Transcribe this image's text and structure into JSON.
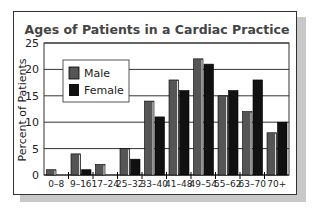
{
  "chart_data": {
    "type": "bar",
    "title": "Ages of Patients in a Cardiac Practice",
    "xlabel": "",
    "ylabel": "Percent of Patients",
    "ylim": [
      0,
      25
    ],
    "yticks": [
      "0",
      "5",
      "10",
      "15",
      "20",
      "25"
    ],
    "grid": true,
    "legend_position": "top-left",
    "categories": [
      "0–8",
      "9–16",
      "17–24",
      "25–32",
      "33–40",
      "41–48",
      "49–54",
      "55–62",
      "63–70",
      "70+"
    ],
    "series": [
      {
        "name": "Male",
        "color": "#555555",
        "values": [
          1,
          4,
          2,
          5,
          14,
          18,
          22,
          15,
          12,
          8
        ]
      },
      {
        "name": "Female",
        "color": "#111111",
        "values": [
          0,
          1,
          0,
          3,
          11,
          16,
          21,
          16,
          18,
          10
        ]
      }
    ]
  }
}
